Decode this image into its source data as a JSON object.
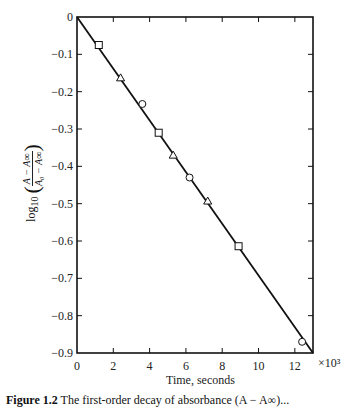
{
  "chart_data": {
    "type": "scatter",
    "title": "",
    "xlabel": "Time, seconds",
    "ylabel": "log10((A - A∞)/(A0 - A∞))",
    "x_multiplier": "×10³",
    "xlim": [
      0,
      13
    ],
    "ylim": [
      -0.9,
      0
    ],
    "x_ticks": [
      0,
      2,
      4,
      6,
      8,
      10,
      12
    ],
    "y_ticks": [
      0,
      -0.1,
      -0.2,
      -0.3,
      -0.4,
      -0.5,
      -0.6,
      -0.7,
      -0.8,
      -0.9
    ],
    "y_tick_labels": [
      "0",
      "-0.1",
      "-0.2",
      "-0.3",
      "-0.4",
      "-0.5",
      "-0.6",
      "-0.7",
      "-0.8",
      "-0.9"
    ],
    "grid": false,
    "fit_line": {
      "x": [
        0,
        13
      ],
      "y": [
        0,
        -0.9
      ]
    },
    "series": [
      {
        "name": "squares",
        "marker": "square",
        "x": [
          1.2,
          4.5,
          8.9
        ],
        "y": [
          -0.075,
          -0.31,
          -0.614
        ]
      },
      {
        "name": "triangles",
        "marker": "triangle",
        "x": [
          2.4,
          5.3,
          7.2
        ],
        "y": [
          -0.163,
          -0.37,
          -0.493
        ]
      },
      {
        "name": "circles",
        "marker": "circle",
        "x": [
          3.6,
          6.2,
          12.4
        ],
        "y": [
          -0.233,
          -0.43,
          -0.87
        ]
      }
    ]
  },
  "labels": {
    "xlabel": "Time, seconds",
    "multiplier": "×10³",
    "ylabel_prefix": "log",
    "ylabel_sub": "10",
    "ylabel_num": "A − A∞",
    "ylabel_den": "A₀ − A∞",
    "caption_bold": "Figure 1.2",
    "caption_rest": "  The first-order decay of absorbance (A − A∞)..."
  }
}
